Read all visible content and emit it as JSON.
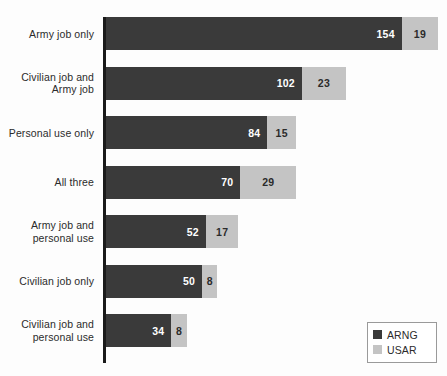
{
  "chart_data": {
    "type": "bar",
    "orientation": "horizontal",
    "stacked": true,
    "title": "",
    "subtitle": "",
    "xlabel": "",
    "ylabel": "",
    "xlim": [
      0,
      180
    ],
    "grid": false,
    "legend_position": "bottom-right",
    "categories": [
      "Army job only",
      "Civilian job and Army job",
      "Personal use only",
      "All three",
      "Army job and personal use",
      "Civilian job only",
      "Civilian job and personal use"
    ],
    "category_lines": [
      [
        "Army job only"
      ],
      [
        "Civilian job and",
        "Army job"
      ],
      [
        "Personal use only"
      ],
      [
        "All three"
      ],
      [
        "Army job and",
        "personal use"
      ],
      [
        "Civilian job only"
      ],
      [
        "Civilian job and",
        "personal use"
      ]
    ],
    "series": [
      {
        "name": "ARNG",
        "color": "#3a3a3a",
        "values": [
          154,
          102,
          84,
          70,
          52,
          50,
          34
        ]
      },
      {
        "name": "USAR",
        "color": "#c4c4c4",
        "values": [
          19,
          23,
          15,
          29,
          17,
          8,
          8
        ]
      }
    ],
    "totals": [
      173,
      125,
      99,
      99,
      69,
      58,
      42
    ],
    "data_labels": [
      {
        "category": "Army job only",
        "ARNG": 154,
        "USAR": 19
      },
      {
        "category": "Civilian job and Army job",
        "ARNG": 102,
        "USAR": 23
      },
      {
        "category": "Personal use only",
        "ARNG": 84,
        "USAR": 15
      },
      {
        "category": "All three",
        "ARNG": 70,
        "USAR": 29
      },
      {
        "category": "Army job and personal use",
        "ARNG": 52,
        "USAR": 17
      },
      {
        "category": "Civilian job only",
        "ARNG": 50,
        "USAR": 8
      },
      {
        "category": "Civilian job and personal use",
        "ARNG": 34,
        "USAR": 8
      }
    ]
  },
  "legend": {
    "items": [
      {
        "label": "ARNG",
        "color": "#3a3a3a",
        "swatch_icon": "square-filled-dark-icon"
      },
      {
        "label": "USAR",
        "color": "#c4c4c4",
        "swatch_icon": "square-filled-light-icon"
      }
    ]
  },
  "style": {
    "axis_color": "#1a1a1a",
    "background": "#fdfdfd",
    "label_color": "#2b2b2b",
    "px_per_unit": 1.92
  }
}
